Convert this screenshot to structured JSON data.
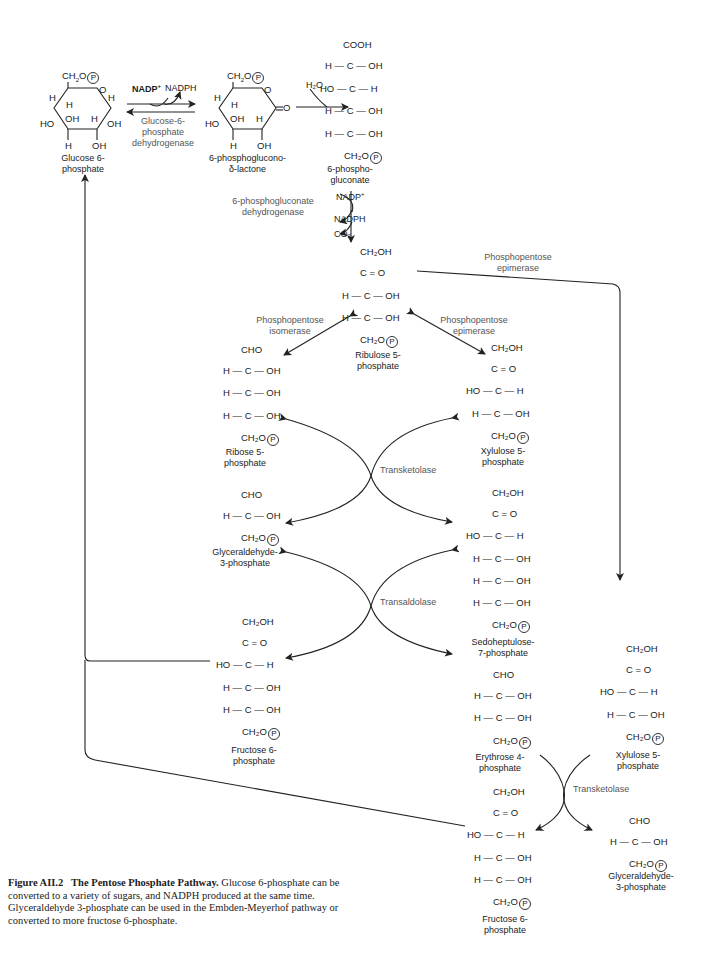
{
  "caption": {
    "figure_number": "Figure AII.2",
    "title": "The Pentose Phosphate Pathway.",
    "body": "Glucose 6-phosphate can be converted to a variety of sugars, and NADPH produced at the same time. Glyceraldehyde 3-phosphate can be used in the Embden-Meyerhof pathway or converted to more fructose 6-phosphate."
  },
  "molecules": {
    "glucose6p": {
      "name_line1": "Glucose 6-",
      "name_line2": "phosphate"
    },
    "lactone": {
      "name_line1": "6-phosphoglucono-",
      "name_line2": "δ-lactone"
    },
    "gluconate": {
      "name_line1": "6-phospho-",
      "name_line2": "gluconate"
    },
    "ribulose5p": {
      "name_line1": "Ribulose 5-",
      "name_line2": "phosphate"
    },
    "ribose5p": {
      "name_line1": "Ribose 5-",
      "name_line2": "phosphate"
    },
    "xylulose5p_a": {
      "name_line1": "Xylulose 5-",
      "name_line2": "phosphate"
    },
    "g3p_a": {
      "name_line1": "Glyceraldehyde-",
      "name_line2": "3-phosphate"
    },
    "sedoheptulose7p": {
      "name_line1": "Sedoheptulose-",
      "name_line2": "7-phosphate"
    },
    "fructose6p_a": {
      "name_line1": "Fructose 6-",
      "name_line2": "phosphate"
    },
    "erythrose4p": {
      "name_line1": "Erythrose 4-",
      "name_line2": "phosphate"
    },
    "xylulose5p_b": {
      "name_line1": "Xylulose 5-",
      "name_line2": "phosphate"
    },
    "fructose6p_b": {
      "name_line1": "Fructose 6-",
      "name_line2": "phosphate"
    },
    "g3p_b": {
      "name_line1": "Glyceraldehyde-",
      "name_line2": "3-phosphate"
    }
  },
  "enzymes": {
    "g6pdh": {
      "line1": "Glucose-6-",
      "line2": "phosphate",
      "line3": "dehydrogenase"
    },
    "pgdh": {
      "line1": "6-phosphogluconate",
      "line2": "dehydrogenase"
    },
    "isomerase": {
      "line1": "Phosphopentose",
      "line2": "isomerase"
    },
    "epimerase_a": {
      "line1": "Phosphopentose",
      "line2": "epimerase"
    },
    "epimerase_b": {
      "line1": "Phosphopentose",
      "line2": "epimerase"
    },
    "transketolase_a": "Transketolase",
    "transaldolase": "Transaldolase",
    "transketolase_b": "Transketolase"
  },
  "cofactors": {
    "nadp_in_1": "NADP",
    "nadph_out_1": "NADPH",
    "water": "H₂O",
    "nadp_in_2": "NADP",
    "nadph_out_2": "NADPH",
    "co2_out": "CO₂"
  },
  "chains": {
    "gluconate": [
      "COOH",
      "H — C — OH",
      "HO — C — H",
      "H — C — OH",
      "H — C — OH",
      "CH₂O"
    ],
    "ribulose5p": [
      "CH₂OH",
      "C = O",
      "H — C — OH",
      "H — C — OH",
      "CH₂O"
    ],
    "ribose5p": [
      "CHO",
      "H — C — OH",
      "H — C — OH",
      "H — C — OH",
      "CH₂O"
    ],
    "xylulose5p": [
      "CH₂OH",
      "C = O",
      "HO — C — H",
      "H — C — OH",
      "CH₂O"
    ],
    "g3p": [
      "CHO",
      "H — C — OH",
      "CH₂O"
    ],
    "sedoheptulose7p": [
      "CH₂OH",
      "C = O",
      "HO — C — H",
      "H — C — OH",
      "H — C — OH",
      "H — C — OH",
      "CH₂O"
    ],
    "fructose6p": [
      "CH₂OH",
      "C = O",
      "HO — C — H",
      "H — C — OH",
      "H — C — OH",
      "CH₂O"
    ],
    "erythrose4p": [
      "CHO",
      "H — C — OH",
      "H — C — OH",
      "CH₂O"
    ]
  },
  "phosphate_symbol": "P"
}
